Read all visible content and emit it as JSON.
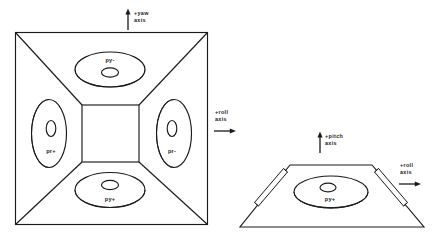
{
  "figure": {
    "line_color": "#1a1a1a",
    "background": "#ffffff"
  },
  "axis_labels": {
    "yaw": {
      "line1": "+yaw",
      "line2": "axis",
      "direction": "up"
    },
    "roll_left": {
      "line1": "+roll",
      "line2": "axis",
      "direction": "right"
    },
    "pitch": {
      "line1": "+pitch",
      "line2": "axis",
      "direction": "up"
    },
    "roll_right": {
      "line1": "+roll",
      "line2": "axis",
      "direction": "right"
    }
  },
  "plan_view": {
    "name": "plan-view",
    "ports": [
      {
        "id": "top",
        "label": "py-",
        "label_position": "above-hole"
      },
      {
        "id": "left",
        "label": "pr+",
        "label_position": "below-hole"
      },
      {
        "id": "right",
        "label": "pr-",
        "label_position": "below-hole"
      },
      {
        "id": "bottom",
        "label": "py+",
        "label_position": "below-hole"
      }
    ]
  },
  "side_view": {
    "name": "side-view",
    "ports": [
      {
        "id": "center",
        "label": "py+",
        "label_position": "below-hole"
      }
    ],
    "rails": 2
  }
}
